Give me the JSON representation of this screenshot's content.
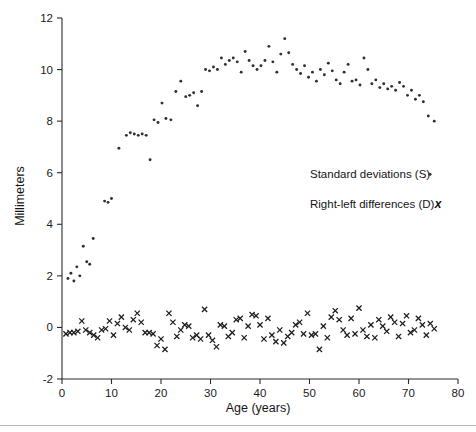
{
  "chart_data": {
    "type": "scatter",
    "title": "",
    "xlabel": "Age (years)",
    "ylabel": "Millimeters",
    "xlim": [
      0,
      80
    ],
    "ylim": [
      -2,
      12
    ],
    "xticks": [
      0,
      10,
      20,
      30,
      40,
      50,
      60,
      70,
      80
    ],
    "yticks": [
      -2,
      0,
      2,
      4,
      6,
      8,
      10,
      12
    ],
    "xtick_labels": [
      "0",
      "10",
      "20",
      "30",
      "40",
      "50",
      "60",
      "70",
      "80"
    ],
    "ytick_labels": [
      "-2",
      "0",
      "2",
      "4",
      "6",
      "8",
      "10",
      "12"
    ],
    "grid": false,
    "legend_position": "right-middle",
    "marker_colors": {
      "standard_deviations": "#2e2e33",
      "right_left_differences": "#1d1d20"
    },
    "series": [
      {
        "name": "Standard deviations (S)",
        "key": "standard_deviations",
        "marker": "dot",
        "marker_symbol": "·",
        "points": [
          [
            1.2,
            1.9
          ],
          [
            1.8,
            2.1
          ],
          [
            2.4,
            1.8
          ],
          [
            3.0,
            2.35
          ],
          [
            3.6,
            2.0
          ],
          [
            4.3,
            3.15
          ],
          [
            5.0,
            2.55
          ],
          [
            5.6,
            2.45
          ],
          [
            6.3,
            3.45
          ],
          [
            8.6,
            4.9
          ],
          [
            9.3,
            4.85
          ],
          [
            10.0,
            5.0
          ],
          [
            11.5,
            6.95
          ],
          [
            13.0,
            7.45
          ],
          [
            13.8,
            7.55
          ],
          [
            14.6,
            7.5
          ],
          [
            15.4,
            7.45
          ],
          [
            16.2,
            7.5
          ],
          [
            17.0,
            7.45
          ],
          [
            17.8,
            6.5
          ],
          [
            18.6,
            8.05
          ],
          [
            19.4,
            7.95
          ],
          [
            20.2,
            8.7
          ],
          [
            21.0,
            8.1
          ],
          [
            22.0,
            8.05
          ],
          [
            23.0,
            9.15
          ],
          [
            24.0,
            9.55
          ],
          [
            25.0,
            8.95
          ],
          [
            25.8,
            9.0
          ],
          [
            26.6,
            9.1
          ],
          [
            27.4,
            8.6
          ],
          [
            28.2,
            9.15
          ],
          [
            29.0,
            10.0
          ],
          [
            29.8,
            9.95
          ],
          [
            30.6,
            10.1
          ],
          [
            31.4,
            10.0
          ],
          [
            32.2,
            10.45
          ],
          [
            33.0,
            10.2
          ],
          [
            33.8,
            10.35
          ],
          [
            34.6,
            10.45
          ],
          [
            35.4,
            10.3
          ],
          [
            36.2,
            9.9
          ],
          [
            37.0,
            10.7
          ],
          [
            37.8,
            10.35
          ],
          [
            38.6,
            10.15
          ],
          [
            39.4,
            10.0
          ],
          [
            40.2,
            10.15
          ],
          [
            41.0,
            10.35
          ],
          [
            41.8,
            10.9
          ],
          [
            42.6,
            10.3
          ],
          [
            43.4,
            9.9
          ],
          [
            44.2,
            10.6
          ],
          [
            45.0,
            11.2
          ],
          [
            45.8,
            10.65
          ],
          [
            46.6,
            10.2
          ],
          [
            47.4,
            10.0
          ],
          [
            48.2,
            9.85
          ],
          [
            49.0,
            10.15
          ],
          [
            49.8,
            9.7
          ],
          [
            50.6,
            9.9
          ],
          [
            51.4,
            9.55
          ],
          [
            52.2,
            10.0
          ],
          [
            53.0,
            9.8
          ],
          [
            53.8,
            10.25
          ],
          [
            54.6,
            9.95
          ],
          [
            55.4,
            9.6
          ],
          [
            56.2,
            9.45
          ],
          [
            57.0,
            9.9
          ],
          [
            57.8,
            10.2
          ],
          [
            58.6,
            9.55
          ],
          [
            59.4,
            9.6
          ],
          [
            60.2,
            9.4
          ],
          [
            61.0,
            10.45
          ],
          [
            61.8,
            10.0
          ],
          [
            62.6,
            9.45
          ],
          [
            63.4,
            9.6
          ],
          [
            64.2,
            9.3
          ],
          [
            65.0,
            9.45
          ],
          [
            65.8,
            9.25
          ],
          [
            66.6,
            9.35
          ],
          [
            67.4,
            9.2
          ],
          [
            68.2,
            9.5
          ],
          [
            69.0,
            9.35
          ],
          [
            69.8,
            9.0
          ],
          [
            70.6,
            9.2
          ],
          [
            71.4,
            8.85
          ],
          [
            72.2,
            9.0
          ],
          [
            73.0,
            8.75
          ],
          [
            74.0,
            8.2
          ],
          [
            75.2,
            8.0
          ]
        ]
      },
      {
        "name": "Right-left differences (D)",
        "key": "right_left_differences",
        "marker": "x",
        "marker_symbol": "x",
        "points": [
          [
            0.8,
            -0.25
          ],
          [
            1.6,
            -0.2
          ],
          [
            2.4,
            -0.2
          ],
          [
            3.2,
            -0.15
          ],
          [
            4.0,
            0.25
          ],
          [
            4.8,
            -0.1
          ],
          [
            5.6,
            -0.2
          ],
          [
            6.4,
            -0.3
          ],
          [
            7.2,
            -0.4
          ],
          [
            8.0,
            -0.1
          ],
          [
            8.8,
            -0.05
          ],
          [
            9.6,
            0.25
          ],
          [
            10.4,
            -0.3
          ],
          [
            11.2,
            0.15
          ],
          [
            12.0,
            0.4
          ],
          [
            12.8,
            0.0
          ],
          [
            13.6,
            -0.1
          ],
          [
            14.4,
            0.3
          ],
          [
            15.2,
            0.55
          ],
          [
            16.0,
            0.2
          ],
          [
            16.8,
            -0.2
          ],
          [
            17.6,
            -0.2
          ],
          [
            18.4,
            -0.25
          ],
          [
            19.2,
            -0.7
          ],
          [
            20.0,
            -0.45
          ],
          [
            20.8,
            -0.85
          ],
          [
            21.6,
            0.55
          ],
          [
            22.4,
            0.2
          ],
          [
            23.2,
            -0.35
          ],
          [
            24.0,
            -0.1
          ],
          [
            24.8,
            0.1
          ],
          [
            25.6,
            0.05
          ],
          [
            26.4,
            -0.4
          ],
          [
            27.2,
            -0.3
          ],
          [
            28.0,
            -0.45
          ],
          [
            28.8,
            0.7
          ],
          [
            29.6,
            -0.3
          ],
          [
            30.4,
            -0.5
          ],
          [
            31.2,
            -0.75
          ],
          [
            32.0,
            0.1
          ],
          [
            32.8,
            0.05
          ],
          [
            33.6,
            -0.35
          ],
          [
            34.4,
            -0.2
          ],
          [
            35.2,
            0.3
          ],
          [
            36.0,
            0.35
          ],
          [
            36.8,
            -0.4
          ],
          [
            37.6,
            0.05
          ],
          [
            38.4,
            0.5
          ],
          [
            39.2,
            0.45
          ],
          [
            40.0,
            0.1
          ],
          [
            40.8,
            -0.45
          ],
          [
            41.6,
            0.35
          ],
          [
            42.4,
            -0.3
          ],
          [
            43.2,
            -0.55
          ],
          [
            44.0,
            -0.1
          ],
          [
            44.8,
            -0.6
          ],
          [
            45.6,
            -0.35
          ],
          [
            46.4,
            -0.2
          ],
          [
            47.2,
            0.1
          ],
          [
            48.0,
            0.2
          ],
          [
            48.8,
            -0.25
          ],
          [
            49.6,
            0.55
          ],
          [
            50.4,
            -0.3
          ],
          [
            51.2,
            -0.25
          ],
          [
            52.0,
            -0.85
          ],
          [
            52.8,
            0.05
          ],
          [
            53.6,
            -0.4
          ],
          [
            54.4,
            0.4
          ],
          [
            55.2,
            0.65
          ],
          [
            56.0,
            0.3
          ],
          [
            56.8,
            -0.1
          ],
          [
            57.6,
            -0.3
          ],
          [
            58.4,
            0.35
          ],
          [
            59.2,
            -0.25
          ],
          [
            60.0,
            0.75
          ],
          [
            60.8,
            -0.1
          ],
          [
            61.6,
            -0.35
          ],
          [
            62.4,
            0.1
          ],
          [
            63.2,
            -0.4
          ],
          [
            64.0,
            0.3
          ],
          [
            64.8,
            0.05
          ],
          [
            65.6,
            -0.15
          ],
          [
            66.4,
            0.4
          ],
          [
            67.2,
            0.2
          ],
          [
            68.0,
            -0.35
          ],
          [
            68.8,
            0.15
          ],
          [
            69.6,
            0.45
          ],
          [
            70.4,
            -0.2
          ],
          [
            71.2,
            -0.1
          ],
          [
            72.0,
            0.35
          ],
          [
            72.8,
            0.1
          ],
          [
            73.6,
            -0.3
          ],
          [
            74.4,
            0.15
          ],
          [
            75.2,
            -0.05
          ]
        ]
      }
    ]
  },
  "legend": {
    "entries": [
      {
        "label": "Standard deviations (S)",
        "marker": "·"
      },
      {
        "label": "Right-left differences (D)",
        "marker": "x"
      }
    ]
  },
  "axes": {
    "y_title": "Millimeters",
    "x_title": "Age (years)"
  }
}
